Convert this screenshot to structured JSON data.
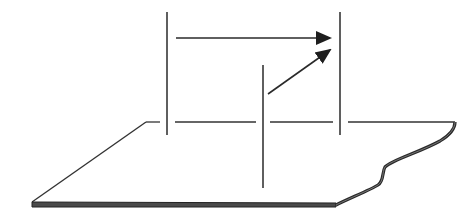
{
  "diagram": {
    "colors": {
      "stroke": "#2a2a2a",
      "background": "#ffffff",
      "plane_edge": "#3a3a3a"
    },
    "elements": {
      "left_line": {
        "x": 167,
        "y1": 12,
        "y2": 135
      },
      "right_line": {
        "x": 340,
        "y1": 12,
        "y2": 135
      },
      "middle_line": {
        "x": 263,
        "y1": 65,
        "y2": 188
      },
      "horizontal_arrow": {
        "x1": 176,
        "y1": 38,
        "x2": 330,
        "y2": 38
      },
      "diagonal_arrow": {
        "x1": 268,
        "y1": 94,
        "x2": 330,
        "y2": 50
      },
      "plane": {
        "top_edge_y": 122,
        "top_left": [
          146,
          122
        ],
        "top_right": [
          455,
          122
        ],
        "bottom_left": [
          32,
          204
        ],
        "bottom_right_start": [
          336,
          205
        ]
      }
    },
    "labels": []
  }
}
